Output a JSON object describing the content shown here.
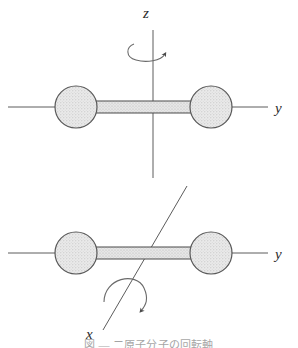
{
  "figure": {
    "background_color": "#ffffff",
    "ink_color": "#3a3a3a",
    "sphere_fill": "#e2e2e2",
    "sphere_stroke": "#555555",
    "bond_fill": "#d8d8d8",
    "bond_stroke": "#4a4a4a",
    "width": 298,
    "height": 348
  },
  "panels": [
    {
      "id": "top-panel",
      "name": "rotation-about-z-axis",
      "description": "Diatomic molecule lying along the y axis, rotating about the vertical z axis",
      "rotation_axis_label": "z",
      "horizontal_axis_label": "y",
      "atoms": [
        {
          "name": "left-atom",
          "cx": 76,
          "cy": 107,
          "r": 21
        },
        {
          "name": "right-atom",
          "cx": 211,
          "cy": 107,
          "r": 21
        }
      ],
      "bond": {
        "x1": 92,
        "y1": 101,
        "x2": 196,
        "y2": 113
      },
      "horizontal_axis": {
        "x1": 8,
        "y1": 107,
        "x2": 268,
        "y2": 107
      },
      "vertical_axis": {
        "x1": 153,
        "y1": 30,
        "x2": 153,
        "y2": 178
      },
      "rotation_arrow": "clockwise-ellipse-around-z",
      "labels": {
        "z": {
          "text": "z",
          "x": 151,
          "y": 16
        },
        "y": {
          "text": "y",
          "x": 277,
          "y": 113
        }
      }
    },
    {
      "id": "bottom-panel",
      "name": "rotation-about-x-axis",
      "description": "Diatomic molecule lying along the y axis, rotating about the inclined x axis",
      "rotation_axis_label": "x",
      "horizontal_axis_label": "y",
      "atoms": [
        {
          "name": "left-atom",
          "cx": 76,
          "cy": 253,
          "r": 21
        },
        {
          "name": "right-atom",
          "cx": 211,
          "cy": 253,
          "r": 21
        }
      ],
      "bond": {
        "x1": 92,
        "y1": 247,
        "x2": 196,
        "y2": 259
      },
      "horizontal_axis": {
        "x1": 8,
        "y1": 253,
        "x2": 268,
        "y2": 253
      },
      "inclined_axis": {
        "x1": 103,
        "y1": 330,
        "x2": 187,
        "y2": 186
      },
      "rotation_arrow": "clockwise-arc-around-x",
      "labels": {
        "x": {
          "text": "x",
          "x": 88,
          "y": 337
        },
        "y": {
          "text": "y",
          "x": 277,
          "y": 259
        }
      }
    }
  ],
  "caption": {
    "name": "figure-caption",
    "text": "図 — 二原子分子の回転軸",
    "clipped": true,
    "note": "Caption is cut off by the bottom edge of the screenshot; only the top few pixels of the glyphs are visible."
  }
}
